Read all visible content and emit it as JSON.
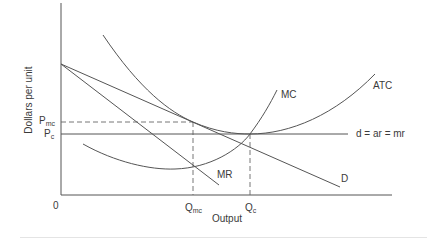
{
  "diagram": {
    "type": "economics-cost-curves",
    "axes": {
      "y_label": "Dollars per unit",
      "x_label": "Output",
      "origin": "0"
    },
    "price_labels": {
      "pmc": {
        "main": "P",
        "sub": "mc"
      },
      "pc": {
        "main": "P",
        "sub": "c"
      }
    },
    "quantity_labels": {
      "qmc": {
        "main": "Q",
        "sub": "mc"
      },
      "qc": {
        "main": "Q",
        "sub": "c"
      }
    },
    "curves": [
      {
        "name": "ATC",
        "label": "ATC",
        "shape": "U-shaped, tangent to D at Qmc, minimum at Qc"
      },
      {
        "name": "MC",
        "label": "MC",
        "shape": "U-shaped, passes through ATC minimum"
      },
      {
        "name": "D",
        "label": "D",
        "shape": "downward sloping demand"
      },
      {
        "name": "MR",
        "label": "MR",
        "shape": "downward sloping, steeper than D"
      },
      {
        "name": "d",
        "label": "d = ar = mr",
        "shape": "horizontal at Pc"
      }
    ],
    "colors": {
      "line": "#555555",
      "text": "#3a3a3a"
    }
  }
}
